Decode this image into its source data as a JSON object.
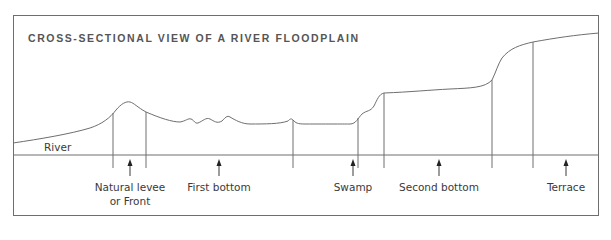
{
  "title": "CROSS-SECTIONAL VIEW OF A RIVER FLOODPLAIN",
  "river_label": "River",
  "zones": [
    {
      "name": "natural-levee",
      "line1": "Natural levee",
      "line2": "or Front",
      "arrow_x": 130
    },
    {
      "name": "first-bottom",
      "line1": "First bottom",
      "line2": "",
      "arrow_x": 219
    },
    {
      "name": "swamp",
      "line1": "Swamp",
      "line2": "",
      "arrow_x": 353
    },
    {
      "name": "second-bottom",
      "line1": "Second bottom",
      "line2": "",
      "arrow_x": 439
    },
    {
      "name": "terrace",
      "line1": "Terrace",
      "line2": "",
      "arrow_x": 566
    }
  ],
  "colors": {
    "line": "#6e6e6e",
    "text": "#3a3a3a",
    "title": "#555555"
  }
}
